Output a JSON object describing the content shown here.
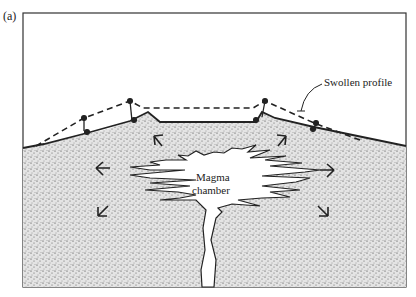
{
  "figure": {
    "panel_label": "(a)",
    "labels": {
      "swollen_profile": "Swollen profile",
      "magma_line1": "Magma",
      "magma_line2": "chamber"
    },
    "colors": {
      "ink": "#222222",
      "rock_fill": "#d9d9d9",
      "magma_fill": "#ffffff",
      "background": "#ffffff"
    },
    "arrows": [
      {
        "direction": "up-left",
        "x": 160,
        "y": 140
      },
      {
        "direction": "up-right",
        "x": 280,
        "y": 140
      },
      {
        "direction": "left",
        "x": 100,
        "y": 170
      },
      {
        "direction": "right",
        "x": 328,
        "y": 170
      },
      {
        "direction": "down-left",
        "x": 104,
        "y": 210
      },
      {
        "direction": "down-right",
        "x": 322,
        "y": 210
      }
    ]
  }
}
